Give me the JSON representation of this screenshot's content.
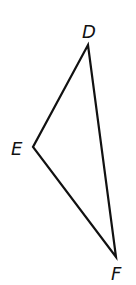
{
  "diagram": {
    "type": "triangle",
    "stroke_color": "#111111",
    "vertices": [
      {
        "label": "D",
        "x": 88,
        "y": 45
      },
      {
        "label": "E",
        "x": 33,
        "y": 147
      },
      {
        "label": "F",
        "x": 116,
        "y": 257
      }
    ],
    "labels": {
      "D": "D",
      "E": "E",
      "F": "F"
    }
  }
}
